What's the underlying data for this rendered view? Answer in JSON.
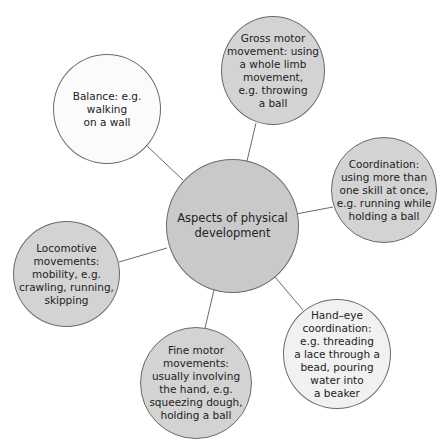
{
  "diagram": {
    "center": {
      "label": "Aspects of physical\ndevelopment"
    },
    "nodes": [
      {
        "id": "balance",
        "label": "Balance: e.g.\nwalking\non a wall",
        "fill": "#fbfbfb"
      },
      {
        "id": "gross-motor",
        "label": "Gross motor\nmovement: using\na whole limb\nmovement,\ne.g. throwing\na ball",
        "fill": "#d3d3d3"
      },
      {
        "id": "coordination",
        "label": "Coordination:\nusing more than\none skill at once,\ne.g. running while\nholding a ball",
        "fill": "#d3d3d3"
      },
      {
        "id": "locomotive",
        "label": "Locomotive\nmovements:\nmobility, e.g.\ncrawling, running,\nskipping",
        "fill": "#d3d3d3"
      },
      {
        "id": "fine-motor",
        "label": "Fine motor\nmovements:\nusually involving\nthe hand, e.g.\nsqueezing dough,\nholding a ball",
        "fill": "#d3d3d3"
      },
      {
        "id": "hand-eye",
        "label": "Hand–eye\ncoordination:\ne.g. threading\na lace through a\nbead, pouring\nwater into\na beaker",
        "fill": "#f1f1f1"
      }
    ],
    "colors": {
      "center_fill": "#c9c9c9",
      "stroke": "#6a6a6a",
      "text": "#222222"
    }
  }
}
